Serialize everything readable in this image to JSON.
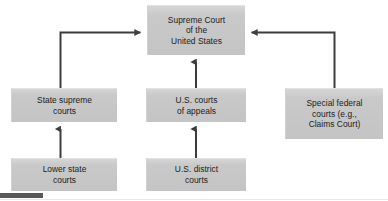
{
  "diagram": {
    "canvas": {
      "width": 388,
      "height": 201
    },
    "colors": {
      "node_fill": "#c8c8c8",
      "node_fill_top": "#d6d6d6",
      "node_text": "#1b1b1b",
      "connector": "#3d3d3d",
      "background": "#ffffff",
      "bottom_bar": "#58585a"
    },
    "nodes": [
      {
        "id": "supreme-court",
        "label": "Supreme Court\nof the\nUnited States",
        "lines": [
          "Supreme Court",
          "of the",
          "United States"
        ]
      },
      {
        "id": "state-supreme-courts",
        "label": "State supreme\ncourts",
        "lines": [
          "State supreme",
          "courts"
        ]
      },
      {
        "id": "us-courts-of-appeals",
        "label": "U.S. courts\nof appeals",
        "lines": [
          "U.S. courts",
          "of appeals"
        ]
      },
      {
        "id": "special-federal-courts",
        "label": "Special federal\ncourts (e.g.,\nClaims Court)",
        "lines": [
          "Special federal",
          "courts (e.g.,",
          "Claims Court)"
        ]
      },
      {
        "id": "lower-state-courts",
        "label": "Lower state\ncourts",
        "lines": [
          "Lower state",
          "courts"
        ]
      },
      {
        "id": "us-district-courts",
        "label": "U.S. district\ncourts",
        "lines": [
          "U.S. district",
          "courts"
        ]
      }
    ],
    "connectors": [
      {
        "id": "state-supreme-to-supreme-court",
        "from": "state-supreme-courts",
        "to": "supreme-court",
        "style": "elbow",
        "arrow_direction": "right"
      },
      {
        "id": "appeals-to-supreme-court",
        "from": "us-courts-of-appeals",
        "to": "supreme-court",
        "style": "straight",
        "arrow_direction": "up"
      },
      {
        "id": "special-federal-to-supreme-court",
        "from": "special-federal-courts",
        "to": "supreme-court",
        "style": "elbow",
        "arrow_direction": "left"
      },
      {
        "id": "lower-state-to-state-supreme",
        "from": "lower-state-courts",
        "to": "state-supreme-courts",
        "style": "straight",
        "arrow_direction": "up"
      },
      {
        "id": "district-to-appeals",
        "from": "us-district-courts",
        "to": "us-courts-of-appeals",
        "style": "straight",
        "arrow_direction": "up"
      }
    ]
  }
}
